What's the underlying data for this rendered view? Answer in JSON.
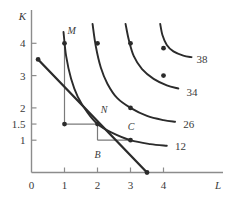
{
  "chart_data": {
    "type": "line",
    "title": "",
    "xlabel": "L",
    "ylabel": "K",
    "xlim": [
      0,
      4.6
    ],
    "ylim": [
      0,
      4.6
    ],
    "grid": false,
    "legend": "none",
    "x_ticks": [
      "0",
      "1",
      "2",
      "3",
      "4"
    ],
    "x_tick_values": [
      0,
      1,
      2,
      3,
      4
    ],
    "y_ticks": [
      "1",
      "1.5",
      "2",
      "3",
      "4"
    ],
    "y_tick_values": [
      1,
      1.5,
      2,
      3,
      4
    ],
    "series": [
      {
        "name": "12",
        "label": "12",
        "kind": "isoquant",
        "points": [
          [
            0.97,
            4.35
          ],
          [
            1.05,
            3.6
          ],
          [
            1.2,
            2.9
          ],
          [
            1.4,
            2.35
          ],
          [
            1.7,
            1.85
          ],
          [
            2.0,
            1.5
          ],
          [
            2.4,
            1.25
          ],
          [
            3.0,
            1.0
          ],
          [
            3.6,
            0.88
          ],
          [
            4.1,
            0.83
          ]
        ],
        "markers": [
          [
            1,
            4
          ],
          [
            2,
            1.5
          ],
          [
            3,
            1
          ]
        ],
        "label_x": 4.35,
        "label_y": 0.82
      },
      {
        "name": "26",
        "label": "26",
        "kind": "isoquant",
        "points": [
          [
            1.85,
            4.6
          ],
          [
            1.95,
            3.9
          ],
          [
            2.1,
            3.25
          ],
          [
            2.3,
            2.75
          ],
          [
            2.6,
            2.3
          ],
          [
            3.0,
            2.0
          ],
          [
            3.5,
            1.75
          ],
          [
            4.0,
            1.62
          ],
          [
            4.35,
            1.57
          ]
        ],
        "markers": [
          [
            2,
            4
          ],
          [
            3,
            2
          ]
        ],
        "label_x": 4.6,
        "label_y": 1.5
      },
      {
        "name": "34",
        "label": "34",
        "kind": "isoquant",
        "points": [
          [
            2.85,
            4.6
          ],
          [
            2.95,
            4.1
          ],
          [
            3.1,
            3.6
          ],
          [
            3.35,
            3.2
          ],
          [
            3.7,
            2.9
          ],
          [
            4.1,
            2.7
          ],
          [
            4.45,
            2.6
          ]
        ],
        "markers": [
          [
            3,
            4
          ],
          [
            4,
            3
          ]
        ],
        "label_x": 4.7,
        "label_y": 2.5
      },
      {
        "name": "38",
        "label": "38",
        "kind": "isoquant",
        "points": [
          [
            3.9,
            4.6
          ],
          [
            3.97,
            4.25
          ],
          [
            4.1,
            3.95
          ],
          [
            4.3,
            3.75
          ],
          [
            4.6,
            3.62
          ],
          [
            4.85,
            3.57
          ]
        ],
        "markers": [
          [
            4,
            3.85
          ]
        ],
        "label_x": 5.0,
        "label_y": 3.5
      },
      {
        "name": "budget-line",
        "label": "",
        "kind": "isocost",
        "points": [
          [
            0.2,
            3.5
          ],
          [
            3.5,
            0.0
          ]
        ],
        "markers": [
          [
            0.2,
            3.5
          ],
          [
            3.5,
            0.0
          ]
        ],
        "label_x": 0,
        "label_y": 0
      }
    ],
    "annotations": [
      {
        "name": "M",
        "label": "M",
        "x": 1.0,
        "y": 4.0,
        "label_dx": 0.22,
        "label_dy": 0.38
      },
      {
        "name": "N",
        "label": "N",
        "x": 2.0,
        "y": 1.5,
        "label_dx": 0.2,
        "label_dy": 0.42
      },
      {
        "name": "B",
        "label": "B",
        "x": 2.0,
        "y": 1.0,
        "label_dx": 0.0,
        "label_dy": -0.45
      },
      {
        "name": "C",
        "label": "C",
        "x": 3.0,
        "y": 1.0,
        "label_dx": 0.02,
        "label_dy": 0.42
      }
    ],
    "guide_lines": [
      {
        "name": "M-vertical",
        "x1": 1.0,
        "y1": 4.0,
        "x2": 1.0,
        "y2": 1.5
      },
      {
        "name": "M-horizontal",
        "x1": 1.0,
        "y1": 1.5,
        "x2": 2.0,
        "y2": 1.5
      },
      {
        "name": "B-vertical",
        "x1": 2.0,
        "y1": 1.5,
        "x2": 2.0,
        "y2": 1.0
      },
      {
        "name": "B-horizontal",
        "x1": 2.0,
        "y1": 1.0,
        "x2": 3.0,
        "y2": 1.0
      }
    ],
    "guide_points": [
      {
        "name": "guide-point-M-corner",
        "x": 1.0,
        "y": 1.5
      }
    ],
    "colors": {
      "axis": "#8c8c8c",
      "curve": "#2b2b2b",
      "guide": "#7a7a7a",
      "text": "#3a3a3a",
      "background": "#ffffff"
    }
  }
}
